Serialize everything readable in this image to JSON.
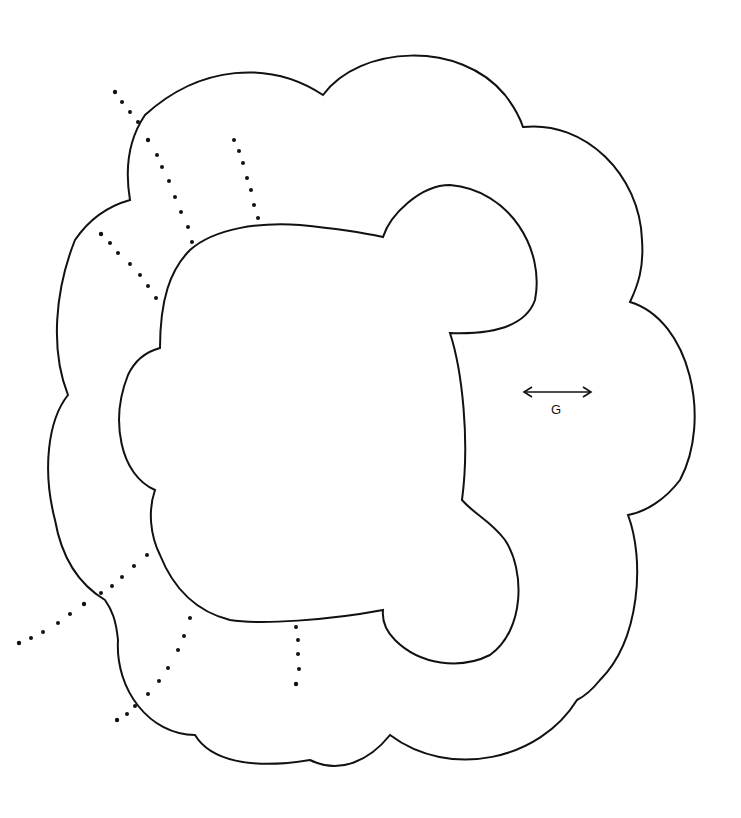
{
  "diagram": {
    "type": "sewing-pattern-piece",
    "colors": {
      "line": "#111111",
      "background": "#ffffff"
    },
    "grainline": {
      "label": "G",
      "icon": "double-headed-arrow-icon"
    },
    "dotted_lines": 8
  }
}
